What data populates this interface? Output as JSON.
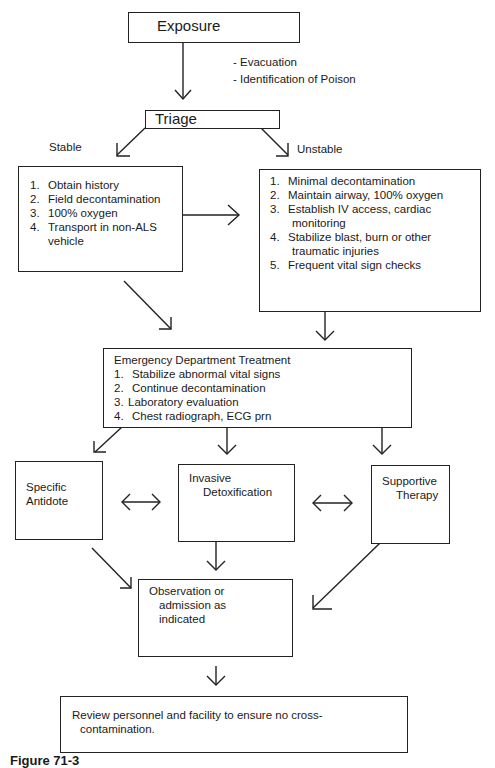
{
  "exposure": {
    "label": "Exposure"
  },
  "exposure_notes": [
    "- Evacuation",
    "- Identification  of  Poison"
  ],
  "triage": {
    "label": "Triage"
  },
  "branches": {
    "stable": "Stable",
    "unstable": "Unstable"
  },
  "stable_box": {
    "items": [
      {
        "num": "1.",
        "text": "Obtain history"
      },
      {
        "num": "2.",
        "text": "Field decontamination"
      },
      {
        "num": "3.",
        "text": "100%  oxygen"
      },
      {
        "num": "4.",
        "text": "Transport in  non-ALS",
        "cont": "vehicle"
      }
    ]
  },
  "unstable_box": {
    "items": [
      {
        "num": "1.",
        "text": "Minimal  decontamination"
      },
      {
        "num": "2.",
        "text": "Maintain airway, 100% oxygen"
      },
      {
        "num": "3.",
        "text": "Establish IV access, cardiac",
        "cont": "monitoring"
      },
      {
        "num": "4.",
        "text": "Stabilize blast, burn or other",
        "cont": "traumatic injuries"
      },
      {
        "num": "5.",
        "text": "Frequent vital sign checks"
      }
    ]
  },
  "ed_box": {
    "title": "Emergency Department Treatment",
    "items": [
      {
        "num": "1.",
        "text": "Stabilize  abnormal vital signs"
      },
      {
        "num": "2.",
        "text": "Continue decontamination"
      },
      {
        "num": "3.",
        "text": "Laboratory  evaluation"
      },
      {
        "num": "4.",
        "text": "Chest  radiograph, ECG prn"
      }
    ]
  },
  "specific_antidote": {
    "line1": "Specific",
    "line2": "Antidote"
  },
  "invasive_detox": {
    "line1": "Invasive",
    "line2": "Detoxification"
  },
  "supportive_therapy": {
    "line1": "Supportive",
    "line2": "Therapy"
  },
  "observation": {
    "line1": "Observation  or",
    "line2": "admission as",
    "line3": "indicated"
  },
  "review": {
    "line1": "Review personnel and facility to ensure no cross-",
    "line2": "contamination."
  },
  "caption": {
    "text": "Figure 71-3"
  }
}
